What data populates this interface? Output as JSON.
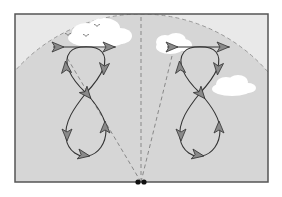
{
  "diagram": {
    "title": "",
    "colors": {
      "outer_background": "#e9e9e9",
      "dome_fill": "#d6d6d6",
      "frame_stroke": "#555555",
      "path_stroke": "#333333",
      "arrow_fill": "#8a8a8a",
      "dashed_stroke": "#888888",
      "cloud_fill": "#ffffff",
      "observer_fill": "#111111"
    },
    "frame": {
      "x": 15,
      "y": 14,
      "width": 253,
      "height": 168
    },
    "observer": {
      "x": 141,
      "y": 182,
      "label": ""
    },
    "dome": {
      "cx": 141,
      "cy": 182,
      "r": 168
    },
    "sight_lines": [
      {
        "name": "left-sight-line",
        "x1": 141,
        "y1": 182,
        "x2": 66,
        "y2": 56
      },
      {
        "name": "center-sight-line",
        "x1": 141,
        "y1": 182,
        "x2": 141,
        "y2": 14
      },
      {
        "name": "right-sight-line",
        "x1": 141,
        "y1": 182,
        "x2": 172,
        "y2": 56
      }
    ],
    "clouds": [
      {
        "name": "cloud-top-left",
        "cx": 95,
        "cy": 35,
        "w": 66,
        "h": 26
      },
      {
        "name": "cloud-top-right",
        "cx": 178,
        "cy": 44,
        "w": 36,
        "h": 20
      },
      {
        "name": "cloud-right",
        "cx": 232,
        "cy": 87,
        "w": 40,
        "h": 20
      }
    ],
    "birds": [
      {
        "x": 68,
        "y": 35
      },
      {
        "x": 86,
        "y": 36
      },
      {
        "x": 97,
        "y": 26
      }
    ],
    "figure_eights": [
      {
        "name": "left-figure-eight",
        "offset_x": 0,
        "arrows": [
          "right",
          "right",
          "down",
          "up",
          "down-right",
          "down",
          "up",
          "right"
        ]
      },
      {
        "name": "right-figure-eight",
        "offset_x": 115,
        "arrows": [
          "right",
          "right",
          "down",
          "up",
          "down-right",
          "down",
          "up",
          "right"
        ]
      }
    ]
  }
}
